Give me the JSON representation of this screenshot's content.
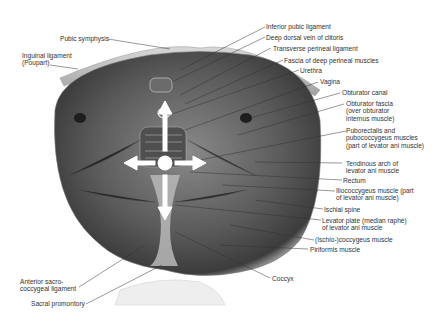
{
  "figure": {
    "background": "#ffffff",
    "ink_color": "#333333",
    "arrow_color": "#ffffff",
    "center_marker": "circle with four arrows (up, down, left, right)"
  },
  "labels_left": [
    {
      "id": "pubic-symphysis",
      "text": "Pubic symphysis"
    },
    {
      "id": "inguinal-ligament",
      "text": "Inguinal ligament (Poupart)"
    },
    {
      "id": "anterior-sacrococcygeal-ligament",
      "text": "Anterior sacro-coccygeal ligament"
    },
    {
      "id": "sacral-promontory",
      "text": "Sacral promontory"
    }
  ],
  "labels_right": [
    {
      "id": "inferior-pubic-ligament",
      "text": "Inferior pubic ligament"
    },
    {
      "id": "deep-dorsal-vein",
      "text": "Deep dorsal vein of clitoris"
    },
    {
      "id": "transverse-perineal-ligament",
      "text": "Transverse perineal ligament"
    },
    {
      "id": "fascia-deep-perineal",
      "text": "Fascia of deep perineal muscles"
    },
    {
      "id": "urethra",
      "text": "Urethra"
    },
    {
      "id": "vagina",
      "text": "Vagina"
    },
    {
      "id": "obturator-canal",
      "text": "Obturator canal"
    },
    {
      "id": "obturator-fascia",
      "text": "Obturator fascia (over obturator internus muscle)"
    },
    {
      "id": "puborectalis",
      "text": "Puborectalis and pubococcygeus muscles (part of levator ani muscle)"
    },
    {
      "id": "tendinous-arch",
      "text": "Tendinous arch of levator ani muscle"
    },
    {
      "id": "rectum",
      "text": "Rectum"
    },
    {
      "id": "iliococcygeus",
      "text": "Iliococcygeus muscle (part of levator ani muscle)"
    },
    {
      "id": "ischial-spine",
      "text": "Ischial spine"
    },
    {
      "id": "levator-plate",
      "text": "Levator plate (median raphé) of levator ani muscle"
    },
    {
      "id": "ischiococcygeus",
      "text": "(Ischio-)coccygeus muscle"
    },
    {
      "id": "piriformis",
      "text": "Piriformis muscle"
    }
  ],
  "labels_bottom": [
    {
      "id": "coccyx",
      "text": "Coccyx"
    }
  ]
}
